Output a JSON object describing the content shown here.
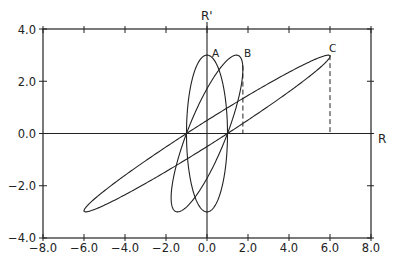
{
  "chart_data": {
    "type": "line",
    "title": "",
    "xlabel": "R",
    "ylabel": "R'",
    "xlim": [
      -8.0,
      8.0
    ],
    "ylim": [
      -4.0,
      4.0
    ],
    "grid": false,
    "legend": "none",
    "x_ticks": [
      "-8.0",
      "-6.0",
      "-4.0",
      "-2.0",
      "0.0",
      "2.0",
      "4.0",
      "6.0",
      "8.0"
    ],
    "y_ticks": [
      "-4.0",
      "-2.0",
      "0.0",
      "2.0",
      "4.0"
    ],
    "x_tick_values": [
      -8,
      -6,
      -4,
      -2,
      0,
      2,
      4,
      6,
      8
    ],
    "y_tick_values": [
      -4,
      -2,
      0,
      2,
      4
    ],
    "series": [
      {
        "name": "A",
        "shape": "ellipse",
        "r_max": 1.0,
        "rprime_max": 3.0,
        "r_intercepts": [
          -1.0,
          1.0
        ],
        "top_point": [
          0.0,
          3.0
        ],
        "bottom_point": [
          0.0,
          -3.0
        ]
      },
      {
        "name": "B",
        "shape": "ellipse",
        "r_max": 1.75,
        "rprime_max": 3.0,
        "r_intercepts": [
          -1.0,
          1.0
        ],
        "top_point": [
          1.44,
          3.0
        ],
        "bottom_point": [
          -1.44,
          -3.0
        ],
        "dashed_drop_x": 1.75
      },
      {
        "name": "C",
        "shape": "ellipse",
        "r_max": 6.0,
        "rprime_max": 3.0,
        "r_intercepts": [
          -1.0,
          1.0
        ],
        "top_point": [
          5.92,
          3.0
        ],
        "bottom_point": [
          -5.92,
          -3.0
        ],
        "dashed_drop_x": 6.0
      }
    ],
    "annotations": [
      {
        "text": "A",
        "x": 0.25,
        "y": 3.1
      },
      {
        "text": "B",
        "x": 1.55,
        "y": 3.1
      },
      {
        "text": "C",
        "x": 6.1,
        "y": 3.3
      }
    ]
  },
  "labels": {
    "x_axis_name": "R",
    "y_axis_name": "R'",
    "curve_a": "A",
    "curve_b": "B",
    "curve_c": "C",
    "x_ticks": [
      "−8.0",
      "−6.0",
      "−4.0",
      "−2.0",
      "0.0",
      "2.0",
      "4.0",
      "6.0",
      "8.0"
    ],
    "y_ticks": [
      "4.0",
      "2.0",
      "0.0",
      "−2.0",
      "−4.0"
    ]
  },
  "style": {
    "line_color": "#222222",
    "background": "#ffffff"
  }
}
